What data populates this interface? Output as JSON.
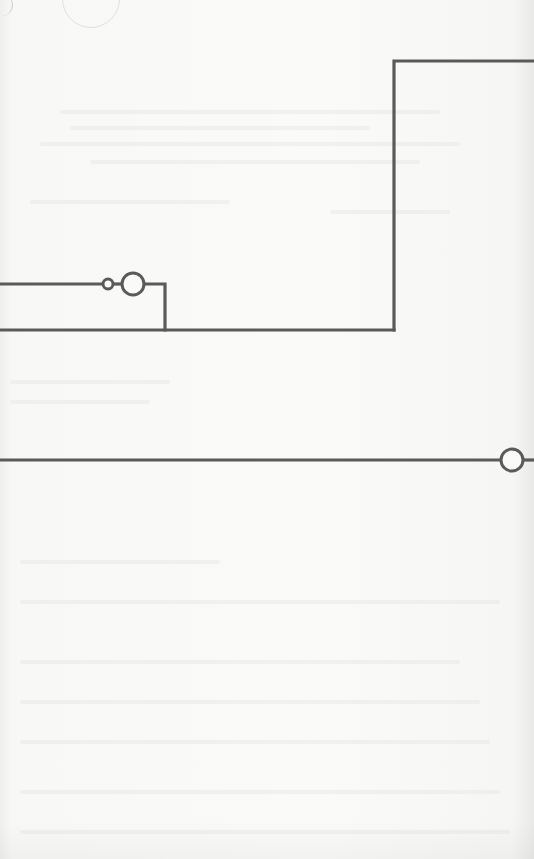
{
  "page": {
    "type": "scanned-schematic-fragment",
    "background_color": "#f7f7f5",
    "wire_color": "#5a5a5a"
  },
  "diagram": {
    "wires": [
      {
        "id": "top-right-rail",
        "points": [
          [
            394,
            330
          ],
          [
            394,
            61
          ],
          [
            534,
            61
          ]
        ]
      },
      {
        "id": "upper-left-wire",
        "points": [
          [
            0,
            284
          ],
          [
            103,
            284
          ]
        ]
      },
      {
        "id": "between-terminals",
        "points": [
          [
            113,
            284
          ],
          [
            122,
            284
          ]
        ]
      },
      {
        "id": "branch-to-lower",
        "points": [
          [
            144,
            284
          ],
          [
            165,
            284
          ],
          [
            165,
            330
          ]
        ]
      },
      {
        "id": "lower-bus",
        "points": [
          [
            0,
            330
          ],
          [
            394,
            330
          ]
        ]
      },
      {
        "id": "bottom-wire",
        "points": [
          [
            0,
            460
          ],
          [
            501,
            460
          ]
        ]
      },
      {
        "id": "bottom-wire-exit",
        "points": [
          [
            523,
            460
          ],
          [
            534,
            460
          ]
        ]
      }
    ],
    "terminals": [
      {
        "id": "small-terminal",
        "cx": 108,
        "cy": 284,
        "r": 5
      },
      {
        "id": "large-terminal",
        "cx": 133,
        "cy": 284,
        "r": 11
      },
      {
        "id": "right-terminal",
        "cx": 512,
        "cy": 460,
        "r": 11
      }
    ]
  }
}
